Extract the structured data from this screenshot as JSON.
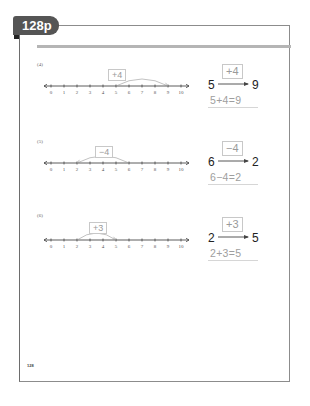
{
  "header": {
    "tab_label": "128p"
  },
  "number_line": {
    "ticks": [
      "0",
      "1",
      "2",
      "3",
      "4",
      "5",
      "6",
      "7",
      "8",
      "9",
      "10"
    ]
  },
  "problems": [
    {
      "label": "(4)",
      "start": 5,
      "end": 9,
      "op_label": "+4",
      "start_text": "5",
      "end_text": "9",
      "equation": "5+4=9"
    },
    {
      "label": "(5)",
      "start": 6,
      "end": 2,
      "op_label": "−4",
      "start_text": "6",
      "end_text": "2",
      "equation": "6−4=2"
    },
    {
      "label": "(6)",
      "start": 2,
      "end": 5,
      "op_label": "+3",
      "start_text": "2",
      "end_text": "5",
      "equation": "2+3=5"
    }
  ],
  "footer": {
    "page_number": "128"
  },
  "colors": {
    "tab": "#555555",
    "rule": "#b5b5b5",
    "border": "#8c8c8c",
    "answer_gray": "#9e9e9e"
  }
}
